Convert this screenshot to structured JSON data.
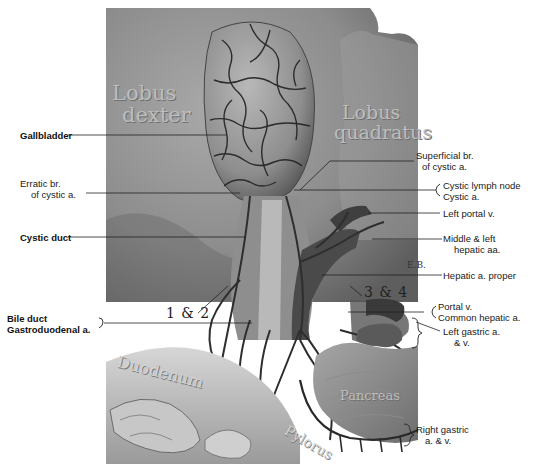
{
  "figure": {
    "signature": "E.B.",
    "colors": {
      "background": "#ffffff",
      "liver": "#8a8a8a",
      "vessel": "#3a3a3a",
      "label": "#1a1a1a"
    }
  },
  "organ_labels": {
    "lobus_dexter_1": "Lobus",
    "lobus_dexter_2": "dexter",
    "lobus_quadratus_1": "Lobus",
    "lobus_quadratus_2": "quadratus",
    "duodenum": "Duodenum",
    "pylorus": "Pylorus",
    "pancreas": "Pancreas"
  },
  "numbers": {
    "left": "1 & 2",
    "right": "3 & 4"
  },
  "labels_left": [
    {
      "id": "gallbladder",
      "lines": [
        "Gallbladder"
      ],
      "bold": true
    },
    {
      "id": "erratic-br",
      "lines": [
        "Erratic br.",
        "of cystic a."
      ],
      "bold": false
    },
    {
      "id": "cystic-duct",
      "lines": [
        "Cystic duct"
      ],
      "bold": true
    },
    {
      "id": "bile-duct-gastroduodenal",
      "lines": [
        "Bile duct",
        "Gastroduodenal a."
      ],
      "bold": true
    }
  ],
  "labels_right": [
    {
      "id": "superficial-br",
      "lines": [
        "Superficial br.",
        "of cystic a."
      ]
    },
    {
      "id": "cystic-lymph-node",
      "lines": [
        "Cystic lymph node",
        "Cystic a."
      ]
    },
    {
      "id": "left-portal-v",
      "lines": [
        "Left portal v."
      ]
    },
    {
      "id": "middle-left-hepatic",
      "lines": [
        "Middle & left",
        "hepatic aa."
      ]
    },
    {
      "id": "hepatic-a-proper",
      "lines": [
        "Hepatic a. proper"
      ]
    },
    {
      "id": "portal-v-common-hepatic",
      "lines": [
        "Portal v.",
        "Common hepatic a."
      ]
    },
    {
      "id": "left-gastric",
      "lines": [
        "Left gastric a.",
        "& v."
      ]
    },
    {
      "id": "right-gastric",
      "lines": [
        "Right gastric",
        "a. & v."
      ]
    }
  ]
}
